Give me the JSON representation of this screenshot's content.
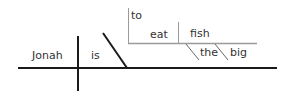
{
  "diagram": {
    "type": "sentence-diagram",
    "sentence": "Jonah is to eat the big fish",
    "words": {
      "subject": "Jonah",
      "verb": "is",
      "infinitive_marker": "to",
      "infinitive_verb": "eat",
      "object": "fish",
      "modifier_1": "the",
      "modifier_2": "big"
    },
    "colors": {
      "main_line": "#1a1a1a",
      "sub_line": "#9a9a9a",
      "text": "#333333"
    }
  }
}
